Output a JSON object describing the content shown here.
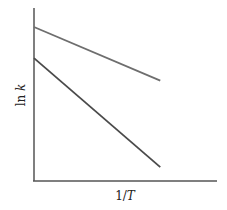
{
  "chart_data": {
    "type": "line",
    "title": "",
    "xlabel": "1/T",
    "ylabel": "ln k",
    "xlabel_parts": {
      "prefix": "1/",
      "var": "T"
    },
    "ylabel_parts": {
      "prefix": "ln ",
      "var": "k"
    },
    "x_ticks": [],
    "y_ticks": [],
    "grid": false,
    "legend": null,
    "xlim": [
      0,
      1
    ],
    "ylim": [
      0,
      1
    ],
    "series": [
      {
        "name": "upper line (smaller slope)",
        "color": "#6e6e6e",
        "x": [
          0,
          0.69
        ],
        "y": [
          0.89,
          0.58
        ]
      },
      {
        "name": "lower line (steeper slope)",
        "color": "#4a4a4a",
        "x": [
          0,
          0.69
        ],
        "y": [
          0.71,
          0.08
        ]
      }
    ]
  }
}
